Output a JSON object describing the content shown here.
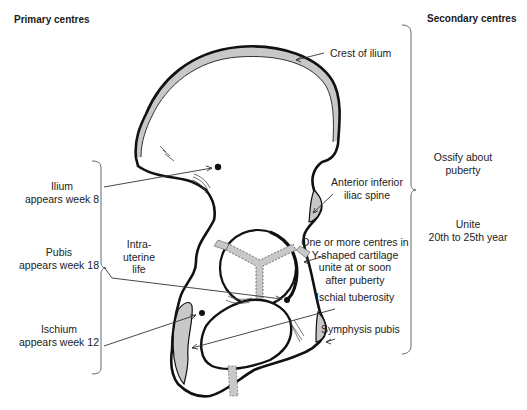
{
  "headers": {
    "primary": "Primary centres",
    "secondary": "Secondary centres"
  },
  "primary_centres": [
    {
      "name": "Ilium",
      "detail": "appears week 8"
    },
    {
      "name": "Pubis",
      "detail": "appears week 18"
    },
    {
      "name": "Ischium",
      "detail": "appears week 12"
    }
  ],
  "primary_group": {
    "line1": "Intra-",
    "line2": "uterine",
    "line3": "life"
  },
  "secondary_labels": {
    "crest": "Crest of ilium",
    "aiis_line1": "Anterior inferior",
    "aiis_line2": "iliac spine",
    "y_line1": "One or more centres in",
    "y_line2": "Y-shaped cartilage",
    "y_line3": "unite at or soon",
    "y_line4": "after puberty",
    "ischial": "Ischial tuberosity",
    "symphysis": "Symphysis  pubis"
  },
  "secondary_groups": {
    "ossify_line1": "Ossify about",
    "ossify_line2": "puberty",
    "unite_line1": "Unite",
    "unite_line2": "20th to 25th year"
  },
  "colors": {
    "outline": "#111111",
    "cartilage_fill": "#c8c8c8",
    "leader": "#333333"
  }
}
